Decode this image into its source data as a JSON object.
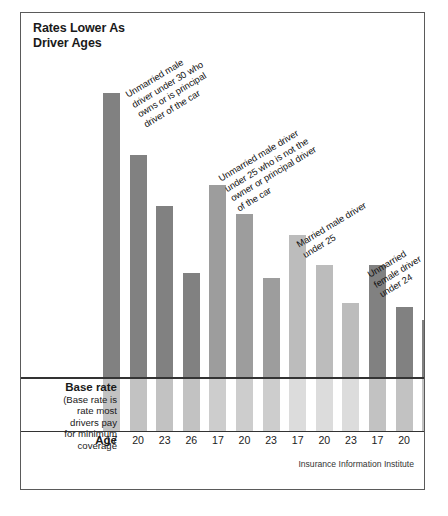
{
  "title": "Rates Lower As\nDriver Ages",
  "source": "Insurance Information Institute",
  "axis": {
    "age_label": "Age"
  },
  "base_rate": {
    "title": "Base rate",
    "body": "(Base rate is\nrate most\ndrivers pay\nfor minimum\ncoverage"
  },
  "colors": {
    "dark": "#818181",
    "mid": "#9d9d9d",
    "light": "#bcbcbc",
    "below_dark": "#c2c2c2",
    "below_mid": "#cdcdcd",
    "below_light": "#dcdcdc",
    "frame": "#5a5a5a",
    "rule": "#333333",
    "text": "#1a1a1a"
  },
  "annotations": [
    {
      "id": "annot-unmarried-male-under-30",
      "text": "Unmarried male\ndriver under 30 who\nowns or is principal\ndriver of the car",
      "x": 103,
      "y": 78
    },
    {
      "id": "annot-unmarried-male-under-25",
      "text": "Unmarried male driver\nunder 25 who is not the\nowner or principal driver\nof the car",
      "x": 196,
      "y": 162
    },
    {
      "id": "annot-married-male-under-25",
      "text": "Married male driver\nunder 25",
      "x": 274,
      "y": 228
    },
    {
      "id": "annot-unmarried-female-under-24",
      "text": "Unmarried\nfemale driver\nunder 24",
      "x": 345,
      "y": 258
    }
  ],
  "chart_data": {
    "type": "bar",
    "title": "Rates Lower As Driver Ages",
    "xlabel": "Age",
    "ylabel": "",
    "grid": false,
    "legend": "none",
    "note": "Bar heights are relative insurance rates; the horizontal rule marks the base rate most drivers pay for minimum coverage.",
    "categories": [
      "17",
      "20",
      "23",
      "26",
      "17",
      "20",
      "23",
      "17",
      "20",
      "23",
      "17",
      "20",
      "23"
    ],
    "groups": [
      {
        "name": "Unmarried male driver under 30 who owns or is principal driver of the car",
        "shade": "dark",
        "ages": [
          "17",
          "20",
          "23",
          "26"
        ],
        "values": [
          305,
          249,
          203,
          142
        ]
      },
      {
        "name": "Unmarried male driver under 25 who is not the owner or principal driver of the car",
        "shade": "mid",
        "ages": [
          "17",
          "20",
          "23"
        ],
        "values": [
          222,
          196,
          138
        ]
      },
      {
        "name": "Married male driver under 25",
        "shade": "light",
        "ages": [
          "17",
          "20",
          "23"
        ],
        "values": [
          177,
          150,
          115
        ]
      },
      {
        "name": "Unmarried female driver under 24",
        "shade": "dark",
        "ages": [
          "17",
          "20",
          "23"
        ],
        "values": [
          150,
          112,
          100
        ]
      }
    ],
    "bars": [
      {
        "age": "17",
        "value": 305,
        "shade": "dark"
      },
      {
        "age": "20",
        "value": 249,
        "shade": "dark"
      },
      {
        "age": "23",
        "value": 203,
        "shade": "dark"
      },
      {
        "age": "26",
        "value": 142,
        "shade": "dark"
      },
      {
        "age": "17",
        "value": 222,
        "shade": "mid"
      },
      {
        "age": "20",
        "value": 196,
        "shade": "mid"
      },
      {
        "age": "23",
        "value": 138,
        "shade": "mid"
      },
      {
        "age": "17",
        "value": 177,
        "shade": "light"
      },
      {
        "age": "20",
        "value": 150,
        "shade": "light"
      },
      {
        "age": "23",
        "value": 115,
        "shade": "light"
      },
      {
        "age": "17",
        "value": 150,
        "shade": "dark"
      },
      {
        "age": "20",
        "value": 112,
        "shade": "dark"
      },
      {
        "age": "23",
        "value": 100,
        "shade": "dark"
      }
    ],
    "base_rate_value": 100,
    "ylim": [
      0,
      320
    ]
  }
}
